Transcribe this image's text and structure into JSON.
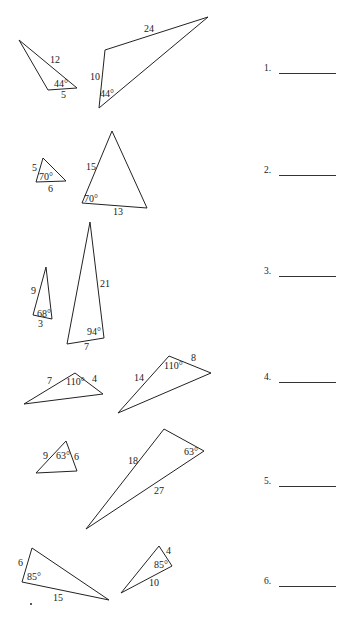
{
  "worksheet": {
    "problems": [
      {
        "number": "1.",
        "answer": "",
        "triangles": [
          {
            "points": "19,40 48,90 77,88",
            "labels": [
              {
                "text": "12",
                "x": 50,
                "y": 63
              },
              {
                "text": "44°",
                "x": 54,
                "y": 87
              },
              {
                "text": "5",
                "x": 61,
                "y": 98
              }
            ]
          },
          {
            "points": "105,50 208,17 99,108",
            "labels": [
              {
                "text": "24",
                "x": 144,
                "y": 32
              },
              {
                "text": "10",
                "x": 90,
                "y": 80
              },
              {
                "text": "44°",
                "x": 100,
                "y": 97
              }
            ]
          }
        ]
      },
      {
        "number": "2.",
        "answer": "",
        "triangles": [
          {
            "points": "43,158 36,182 66,181",
            "labels": [
              {
                "text": "5",
                "x": 32,
                "y": 171
              },
              {
                "text": "70°",
                "x": 39,
                "y": 180
              },
              {
                "text": "6",
                "x": 48,
                "y": 192
              }
            ]
          },
          {
            "points": "112,131 82,203 147,208",
            "labels": [
              {
                "text": "15",
                "x": 86,
                "y": 170
              },
              {
                "text": "70°",
                "x": 84,
                "y": 202
              },
              {
                "text": "13",
                "x": 113,
                "y": 215
              }
            ]
          }
        ]
      },
      {
        "number": "3.",
        "answer": "",
        "triangles": [
          {
            "points": "46,267 33,315 52,319",
            "labels": [
              {
                "text": "9",
                "x": 31,
                "y": 294
              },
              {
                "text": "68°",
                "x": 37,
                "y": 317
              },
              {
                "text": "3",
                "x": 38,
                "y": 327
              }
            ]
          },
          {
            "points": "90,222 67,344 104,338",
            "labels": [
              {
                "text": "21",
                "x": 100,
                "y": 287
              },
              {
                "text": "94°",
                "x": 87,
                "y": 335
              },
              {
                "text": "7",
                "x": 84,
                "y": 350
              }
            ]
          }
        ]
      },
      {
        "number": "4.",
        "answer": "",
        "triangles": [
          {
            "points": "75,373 24,404 103,394",
            "labels": [
              {
                "text": "7",
                "x": 47,
                "y": 384
              },
              {
                "text": "110°",
                "x": 66,
                "y": 385
              },
              {
                "text": "4",
                "x": 92,
                "y": 382
              }
            ]
          },
          {
            "points": "169,356 211,373 118,413",
            "labels": [
              {
                "text": "14",
                "x": 134,
                "y": 381
              },
              {
                "text": "110°",
                "x": 164,
                "y": 369
              },
              {
                "text": "8",
                "x": 191,
                "y": 361
              }
            ]
          }
        ]
      },
      {
        "number": "5.",
        "answer": "",
        "triangles": [
          {
            "points": "66,441 36,473 77,471",
            "labels": [
              {
                "text": "9",
                "x": 43,
                "y": 459
              },
              {
                "text": "63°",
                "x": 56,
                "y": 459
              },
              {
                "text": "6",
                "x": 74,
                "y": 460
              }
            ]
          },
          {
            "points": "164,429 204,451 86,529",
            "labels": [
              {
                "text": "18",
                "x": 128,
                "y": 464
              },
              {
                "text": "63°",
                "x": 184,
                "y": 455
              },
              {
                "text": "27",
                "x": 154,
                "y": 494
              }
            ]
          }
        ]
      },
      {
        "number": "6.",
        "answer": "",
        "triangles": [
          {
            "points": "32,548 22,582 109,600",
            "labels": [
              {
                "text": "6",
                "x": 18,
                "y": 566
              },
              {
                "text": "85°",
                "x": 27,
                "y": 580
              },
              {
                "text": "15",
                "x": 53,
                "y": 601
              }
            ]
          },
          {
            "points": "159,546 172,566 121,593",
            "labels": [
              {
                "text": "4",
                "x": 166,
                "y": 554
              },
              {
                "text": "85°",
                "x": 154,
                "y": 568
              },
              {
                "text": "10",
                "x": 149,
                "y": 586
              }
            ]
          }
        ]
      }
    ],
    "answer_rows_y": [
      63,
      165,
      266,
      372,
      476,
      576
    ]
  }
}
